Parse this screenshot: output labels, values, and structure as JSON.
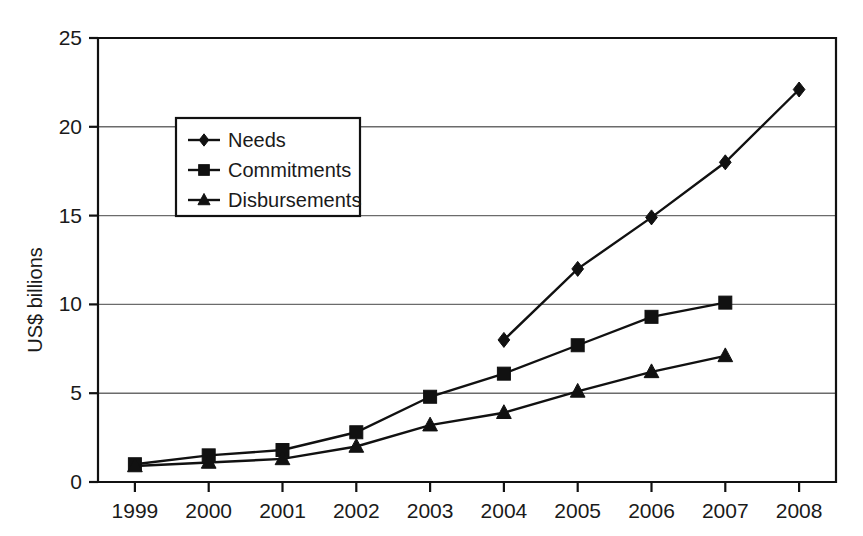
{
  "chart_data": {
    "type": "line",
    "title": "",
    "xlabel": "",
    "ylabel": "US$ billions",
    "categories": [
      "1999",
      "2000",
      "2001",
      "2002",
      "2003",
      "2004",
      "2005",
      "2006",
      "2007",
      "2008"
    ],
    "ylim": [
      0,
      25
    ],
    "yticks": [
      0,
      5,
      10,
      15,
      20,
      25
    ],
    "ytick_labels": [
      "0",
      "5",
      "10",
      "15",
      "20",
      "25"
    ],
    "grid": "horizontal",
    "legend_position": "upper-left-inside",
    "series": [
      {
        "name": "Needs",
        "marker": "diamond",
        "values": [
          null,
          null,
          null,
          null,
          null,
          8.0,
          12.0,
          14.9,
          18.0,
          22.1
        ]
      },
      {
        "name": "Commitments",
        "marker": "square",
        "values": [
          1.0,
          1.5,
          1.8,
          2.8,
          4.8,
          6.1,
          7.7,
          9.3,
          10.1,
          null
        ]
      },
      {
        "name": "Disbursements",
        "marker": "triangle",
        "values": [
          0.9,
          1.1,
          1.3,
          2.0,
          3.2,
          3.9,
          5.1,
          6.2,
          7.1,
          null
        ]
      }
    ]
  },
  "legend": {
    "items": [
      {
        "label": "Needs",
        "marker": "diamond"
      },
      {
        "label": "Commitments",
        "marker": "square"
      },
      {
        "label": "Disbursements",
        "marker": "triangle"
      }
    ]
  },
  "axes": {
    "y_title": "US$ billions",
    "y_tick_labels": [
      "25",
      "20",
      "15",
      "10",
      "5",
      "0"
    ],
    "x_tick_labels": [
      "1999",
      "2000",
      "2001",
      "2002",
      "2003",
      "2004",
      "2005",
      "2006",
      "2007",
      "2008"
    ]
  },
  "colors": {
    "ink": "#111111",
    "grid": "#6b6b6b",
    "background": "#ffffff"
  }
}
